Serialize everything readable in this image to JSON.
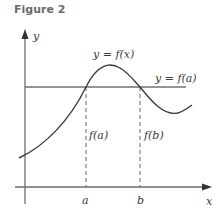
{
  "figure": {
    "title": "Figure 2",
    "labels": {
      "y_axis": "y",
      "x_axis": "x",
      "curve": "y = f(x)",
      "horizontal_line": "y = f(a)",
      "fa": "f(a)",
      "fb": "f(b)",
      "a": "a",
      "b": "b"
    },
    "colors": {
      "axis": "#6e6e6e",
      "curve": "#3c3c3c",
      "horizontal_line": "#707070",
      "dashed": "#555555",
      "text": "#3a3a3a"
    }
  }
}
